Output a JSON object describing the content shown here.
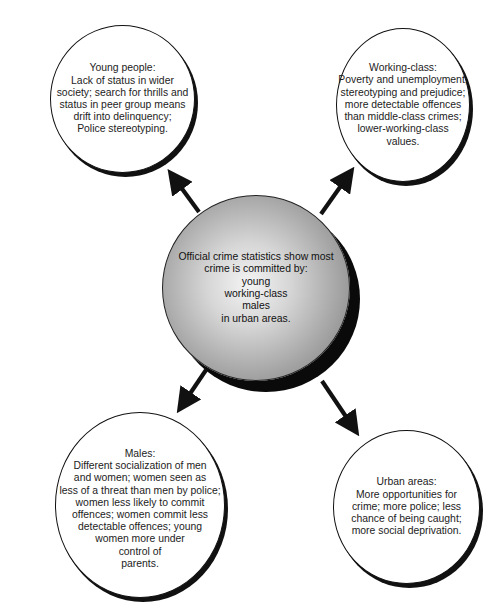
{
  "diagram": {
    "central": {
      "text": "Official crime statistics show most\ncrime is committed by:\nyoung\nworking-class\nmales\nin urban areas."
    },
    "nodes": [
      {
        "id": "young-people",
        "position": "top-left",
        "text": "Young people:\nLack of status in wider\nsociety; search for thrills and\nstatus in peer group means\ndrift into delinquency;\nPolice stereotyping."
      },
      {
        "id": "working-class",
        "position": "top-right",
        "text": "Working-class:\nPoverty and unemployment;\nstereotyping and prejudice;\nmore detectable offences\nthan middle-class crimes;\nlower-working-class\nvalues."
      },
      {
        "id": "males",
        "position": "bottom-left",
        "text": "Males:\nDifferent socialization of men\nand women; women seen as\nless of a threat than men by police;\nwomen less likely to commit\noffences; women commit less\ndetectable offences; young\nwomen more under\ncontrol of\nparents."
      },
      {
        "id": "urban-areas",
        "position": "bottom-right",
        "text": "Urban areas:\nMore opportunities for\ncrime; more police; less\nchance of being caught;\nmore social deprivation."
      }
    ],
    "colors": {
      "outline": "#111111",
      "shadow": "#0a0a0a",
      "central_fill_light": "#f4f4f4",
      "central_fill_dark": "#7a7a7a",
      "background": "#ffffff"
    }
  }
}
